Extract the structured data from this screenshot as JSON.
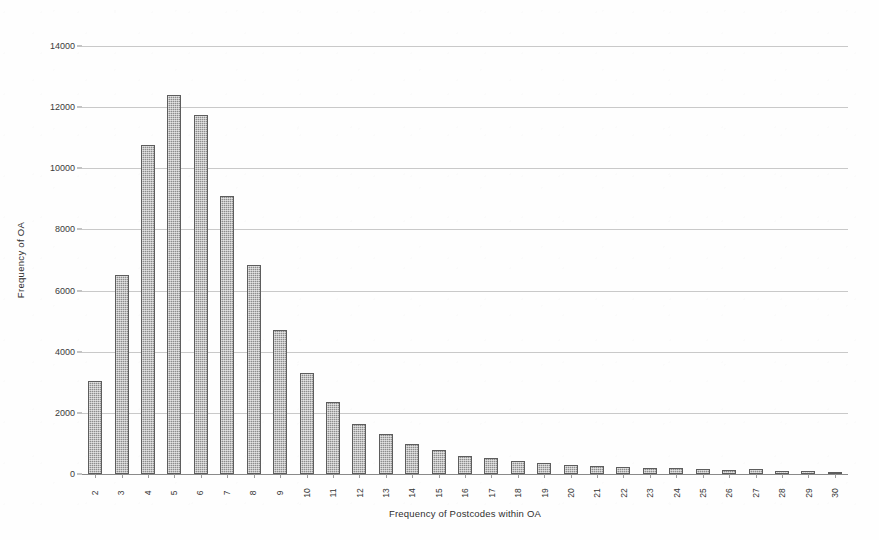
{
  "chart_data": {
    "type": "bar",
    "title": "",
    "xlabel": "Frequency of Postcodes within OA",
    "ylabel": "Frequency of OA",
    "categories": [
      "2",
      "3",
      "4",
      "5",
      "6",
      "7",
      "8",
      "9",
      "10",
      "11",
      "12",
      "13",
      "14",
      "15",
      "16",
      "17",
      "18",
      "19",
      "20",
      "21",
      "22",
      "23",
      "24",
      "25",
      "26",
      "27",
      "28",
      "29",
      "30"
    ],
    "values": [
      3050,
      6500,
      10750,
      12400,
      11750,
      9100,
      6850,
      4700,
      3300,
      2350,
      1650,
      1300,
      980,
      800,
      600,
      540,
      420,
      360,
      300,
      260,
      230,
      210,
      190,
      170,
      120,
      180,
      110,
      90,
      70
    ],
    "ylim": [
      0,
      14000
    ],
    "ytick_values": [
      0,
      2000,
      4000,
      6000,
      8000,
      10000,
      12000,
      14000
    ],
    "ytick_labels": [
      "0",
      "2000",
      "4000",
      "6000",
      "8000",
      "10000",
      "12000",
      "14000"
    ],
    "grid": true,
    "legend": false,
    "legend_position": "none",
    "bar_color": "#8d8d8d",
    "bar_edge_color": "#5d5d5d",
    "gridline_color": "#c9c9c9",
    "axis_color": "#8a8a8a",
    "background_color": "#ffffff"
  }
}
